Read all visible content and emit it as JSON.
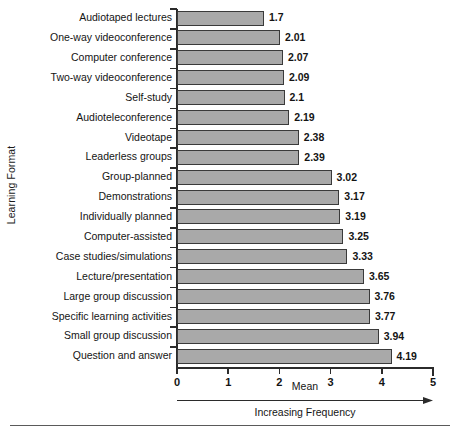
{
  "chart_data": {
    "type": "bar",
    "orientation": "horizontal",
    "title": "",
    "xlabel": "Mean",
    "ylabel": "Learning Format",
    "xlim": [
      0,
      5
    ],
    "xticks": [
      "0",
      "1",
      "2",
      "3",
      "4",
      "5"
    ],
    "grid": false,
    "legend": null,
    "annotations": [
      "Increasing Frequency"
    ],
    "bar_color": "#a9a9a9",
    "bar_border_color": "#3a3a3a",
    "axis_color": "#2b2b2b",
    "categories": [
      "Audiotaped lectures",
      "One-way videoconference",
      "Computer conference",
      "Two-way videoconference",
      "Self-study",
      "Audioteleconference",
      "Videotape",
      "Leaderless groups",
      "Group-planned",
      "Demonstrations",
      "Individually planned",
      "Computer-assisted",
      "Case studies/simulations",
      "Lecture/presentation",
      "Large group discussion",
      "Specific learning activities",
      "Small group discussion",
      "Question and answer"
    ],
    "values": [
      1.7,
      2.01,
      2.07,
      2.09,
      2.1,
      2.19,
      2.38,
      2.39,
      3.02,
      3.17,
      3.19,
      3.25,
      3.33,
      3.65,
      3.76,
      3.77,
      3.94,
      4.19
    ],
    "value_labels": [
      "1.7",
      "2.01",
      "2.07",
      "2.09",
      "2.1",
      "2.19",
      "2.38",
      "2.39",
      "3.02",
      "3.17",
      "3.19",
      "3.25",
      "3.33",
      "3.65",
      "3.76",
      "3.77",
      "3.94",
      "4.19"
    ]
  }
}
